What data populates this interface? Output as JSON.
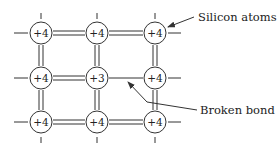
{
  "figure": {
    "type": "silicon crystal lattice with broken bond",
    "colors": {
      "stroke": "#333333",
      "text": "#222222",
      "background": "#ffffff"
    }
  },
  "lattice": {
    "columns_x": [
      41,
      97,
      155
    ],
    "rows_y": [
      33,
      78,
      122
    ],
    "atom_radius": 11,
    "atoms": [
      {
        "row": 0,
        "col": 0,
        "label": "+4"
      },
      {
        "row": 0,
        "col": 1,
        "label": "+4"
      },
      {
        "row": 0,
        "col": 2,
        "label": "+4"
      },
      {
        "row": 1,
        "col": 0,
        "label": "+4"
      },
      {
        "row": 1,
        "col": 1,
        "label": "+3"
      },
      {
        "row": 1,
        "col": 2,
        "label": "+4"
      },
      {
        "row": 2,
        "col": 0,
        "label": "+4"
      },
      {
        "row": 2,
        "col": 1,
        "label": "+4"
      },
      {
        "row": 2,
        "col": 2,
        "label": "+4"
      }
    ],
    "bonds": [
      {
        "from": [
          0,
          0
        ],
        "to": [
          0,
          1
        ],
        "type": "double"
      },
      {
        "from": [
          0,
          1
        ],
        "to": [
          0,
          2
        ],
        "type": "double"
      },
      {
        "from": [
          1,
          0
        ],
        "to": [
          1,
          1
        ],
        "type": "double"
      },
      {
        "from": [
          1,
          1
        ],
        "to": [
          1,
          2
        ],
        "type": "single-broken"
      },
      {
        "from": [
          2,
          0
        ],
        "to": [
          2,
          1
        ],
        "type": "double"
      },
      {
        "from": [
          2,
          1
        ],
        "to": [
          2,
          2
        ],
        "type": "double"
      },
      {
        "from": [
          0,
          0
        ],
        "to": [
          1,
          0
        ],
        "type": "double"
      },
      {
        "from": [
          1,
          0
        ],
        "to": [
          2,
          0
        ],
        "type": "double"
      },
      {
        "from": [
          0,
          1
        ],
        "to": [
          1,
          1
        ],
        "type": "double"
      },
      {
        "from": [
          1,
          1
        ],
        "to": [
          2,
          1
        ],
        "type": "double"
      },
      {
        "from": [
          0,
          2
        ],
        "to": [
          1,
          2
        ],
        "type": "double"
      },
      {
        "from": [
          1,
          2
        ],
        "to": [
          2,
          2
        ],
        "type": "double"
      }
    ]
  },
  "callouts": {
    "silicon_atoms": {
      "text": "Silicon atoms",
      "x": 198,
      "y": 21
    },
    "broken_bond": {
      "text": "Broken bond",
      "x": 200,
      "y": 113
    }
  }
}
